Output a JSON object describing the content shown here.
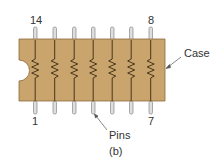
{
  "figure": {
    "caption": "(b)",
    "case_label": "Case",
    "pins_label": "Pins",
    "pin_labels": {
      "top_left": "14",
      "top_right": "8",
      "bottom_left": "1",
      "bottom_right": "7"
    },
    "resistor_count": 7,
    "colors": {
      "case": "#c9a46c",
      "case_edge": "#8a6a3a",
      "pin": "#dcdcdc",
      "pin_edge": "#7a7a7a",
      "wire": "#3a2a14"
    }
  }
}
